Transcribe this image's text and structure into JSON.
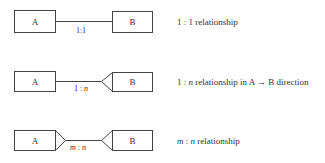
{
  "rows": [
    {
      "left_entity": "A",
      "right_entity": "B",
      "cardinality": {
        "left": "1",
        "sep": ":",
        "right": "1"
      },
      "description": {
        "prefix": "1 : 1",
        "text": " relationship"
      }
    },
    {
      "left_entity": "A",
      "right_entity": "B",
      "cardinality": {
        "left": "1",
        "sep": " : ",
        "right": "n"
      },
      "description": {
        "a": "1 : ",
        "n": "n",
        "text": " relationship in A → B direction"
      }
    },
    {
      "left_entity": "A",
      "right_entity": "B",
      "cardinality": {
        "left": "m",
        "sep": " : ",
        "right": "n"
      },
      "description": {
        "m": "m",
        "sep": " : ",
        "n": "n",
        "text": " relationship"
      }
    }
  ]
}
